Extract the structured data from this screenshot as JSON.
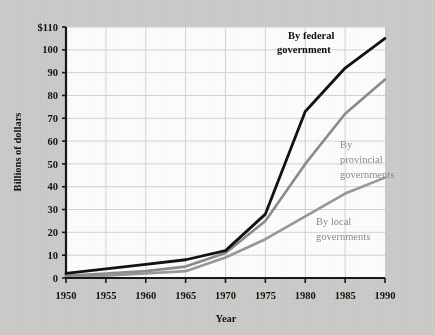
{
  "chart_data": {
    "type": "line",
    "title": "",
    "xlabel": "Year",
    "ylabel": "Billions of dollars",
    "x": [
      1950,
      1955,
      1960,
      1965,
      1970,
      1975,
      1980,
      1985,
      1990
    ],
    "xtick_labels": [
      "1950",
      "1955",
      "1960",
      "1965",
      "1970",
      "1975",
      "1980",
      "1985",
      "1990"
    ],
    "ytick_labels": [
      "0",
      "10",
      "20",
      "30",
      "40",
      "50",
      "60",
      "70",
      "80",
      "90",
      "100",
      "$110"
    ],
    "ytick_values": [
      0,
      10,
      20,
      30,
      40,
      50,
      60,
      70,
      80,
      90,
      100,
      110
    ],
    "xlim": [
      1950,
      1990
    ],
    "ylim": [
      0,
      110
    ],
    "grid": true,
    "legend_position": "inline-annotations",
    "series": [
      {
        "name": "By federal government",
        "color": "#141210",
        "values": [
          2,
          4,
          6,
          8,
          12,
          28,
          73,
          92,
          105
        ]
      },
      {
        "name": "By provincial governments",
        "color": "#8d8d8d",
        "values": [
          1,
          2,
          3,
          5,
          11,
          25,
          50,
          72,
          87
        ]
      },
      {
        "name": "By local governments",
        "color": "#9a9a9a",
        "values": [
          1,
          1,
          2,
          3,
          9,
          17,
          27,
          37,
          44
        ]
      }
    ],
    "annotations": [
      {
        "text_line1": "By federal",
        "text_line2": "government",
        "style": "bold-black"
      },
      {
        "text_line1": "By",
        "text_line2": "provincial",
        "text_line3": "governments",
        "style": "gray"
      },
      {
        "text_line1": "By local",
        "text_line2": "governments",
        "style": "gray"
      }
    ]
  },
  "colors": {
    "background": "#cdcdcb",
    "plot_background": "#ffffff",
    "axis": "#1a1714",
    "gridline": "#d3d6d9",
    "federal": "#141210",
    "provincial": "#8d8d8d",
    "local": "#9a9a9a"
  }
}
